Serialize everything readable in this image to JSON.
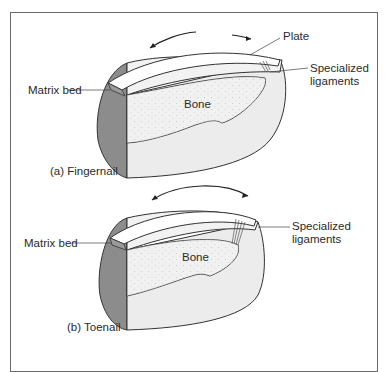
{
  "diagram": {
    "top": {
      "caption": "(a) Fingernail",
      "labels": {
        "plate": "Plate",
        "ligaments_line1": "Specialized",
        "ligaments_line2": "ligaments",
        "matrix_bed": "Matrix bed",
        "bone": "Bone"
      }
    },
    "bottom": {
      "caption": "(b) Toenail",
      "labels": {
        "ligaments_line1": "Specialized",
        "ligaments_line2": "ligaments",
        "matrix_bed": "Matrix bed",
        "bone": "Bone"
      }
    },
    "colors": {
      "border": "#6a6a6a",
      "dark_shade": "#8c8c8c",
      "tissue": "#ececec",
      "bone": "#f6f6f6",
      "line": "#333333"
    }
  }
}
